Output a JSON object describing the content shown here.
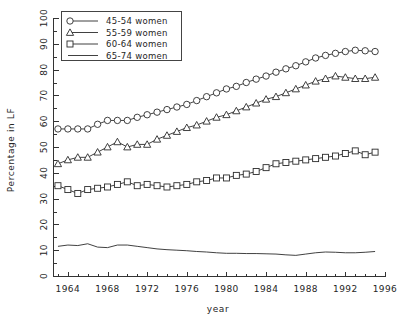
{
  "chart_data": {
    "type": "line",
    "title": "",
    "subtitle": "",
    "xlabel": "year",
    "ylabel": "Percentage in LF",
    "xlim": [
      1962.5,
      1996
    ],
    "ylim": [
      0,
      100
    ],
    "xticks": [
      1964,
      1968,
      1972,
      1976,
      1980,
      1984,
      1988,
      1992,
      1996
    ],
    "yticks": [
      0,
      10,
      20,
      30,
      40,
      50,
      60,
      70,
      80,
      90,
      100
    ],
    "x_minor_step": 1,
    "y_minor_step": 5,
    "grid": false,
    "legend_position": "top-left-inside",
    "x": [
      1963,
      1964,
      1965,
      1966,
      1967,
      1968,
      1969,
      1970,
      1971,
      1972,
      1973,
      1974,
      1975,
      1976,
      1977,
      1978,
      1979,
      1980,
      1981,
      1982,
      1983,
      1984,
      1985,
      1986,
      1987,
      1988,
      1989,
      1990,
      1991,
      1992,
      1993,
      1994,
      1995
    ],
    "series": [
      {
        "name": "45-54 women",
        "marker": "circle",
        "values": [
          57.0,
          57.0,
          57.0,
          57.0,
          58.8,
          60.3,
          60.3,
          60.3,
          61.5,
          62.5,
          63.5,
          64.5,
          65.5,
          66.5,
          68.0,
          69.5,
          71.0,
          72.5,
          73.5,
          75.0,
          76.3,
          77.5,
          79.0,
          80.3,
          81.5,
          83.0,
          84.5,
          85.5,
          86.3,
          87.0,
          87.5,
          87.3,
          87.0
        ]
      },
      {
        "name": "55-59 women",
        "marker": "triangle",
        "values": [
          43.5,
          45.0,
          46.0,
          46.0,
          48.0,
          50.0,
          52.0,
          50.0,
          51.0,
          51.0,
          53.0,
          54.5,
          56.0,
          57.5,
          58.5,
          60.0,
          61.5,
          62.5,
          64.0,
          65.5,
          67.0,
          68.5,
          69.5,
          71.0,
          72.5,
          74.0,
          75.5,
          76.5,
          77.5,
          77.0,
          76.5,
          76.5,
          77.0
        ]
      },
      {
        "name": "60-64 women",
        "marker": "square",
        "values": [
          35.0,
          33.5,
          32.0,
          33.5,
          34.0,
          34.5,
          35.5,
          36.5,
          35.0,
          35.5,
          35.0,
          34.5,
          35.0,
          35.5,
          36.5,
          37.0,
          38.0,
          38.0,
          39.0,
          39.5,
          40.5,
          42.0,
          43.5,
          44.0,
          44.5,
          45.0,
          45.5,
          46.0,
          46.5,
          47.5,
          48.5,
          47.0,
          48.0
        ]
      },
      {
        "name": "65-74 women",
        "marker": "none",
        "values": [
          11.5,
          12.0,
          11.8,
          12.5,
          11.2,
          11.0,
          12.0,
          12.0,
          11.5,
          11.0,
          10.5,
          10.2,
          10.0,
          9.8,
          9.5,
          9.3,
          9.0,
          8.8,
          8.8,
          8.7,
          8.7,
          8.6,
          8.5,
          8.2,
          8.0,
          8.5,
          9.0,
          9.3,
          9.2,
          9.0,
          9.0,
          9.2,
          9.5
        ]
      }
    ]
  },
  "legend": {
    "entries": [
      {
        "label": "45-54 women",
        "marker": "circle"
      },
      {
        "label": "55-59 women",
        "marker": "triangle"
      },
      {
        "label": "60-64 women",
        "marker": "square"
      },
      {
        "label": "65-74 women",
        "marker": "none"
      }
    ]
  },
  "colors": {
    "line": "#2b2b2b",
    "axis": "#333333",
    "background": "#ffffff"
  }
}
